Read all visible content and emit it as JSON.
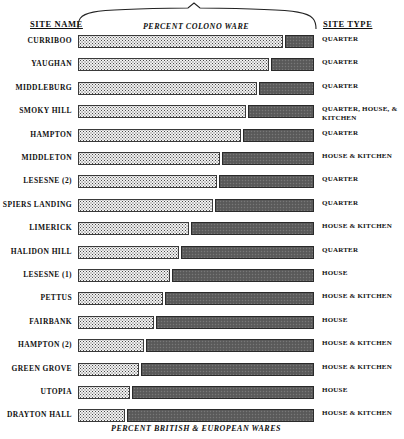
{
  "header": {
    "site_name_label": "SITE  NAME",
    "site_type_label": "SITE  TYPE"
  },
  "captions": {
    "top": "PERCENT COLONO WARE",
    "bottom": "PERCENT BRITISH & EUROPEAN WARES"
  },
  "colors": {
    "colono_fill": "#f2f2f2",
    "colono_stroke": "#3a3a3a",
    "british_fill": "#5e5e5e",
    "british_stroke": "#2a2a2a",
    "text": "#111111",
    "background": "#ffffff"
  },
  "chart_data": {
    "type": "bar",
    "orientation": "horizontal",
    "stacked": true,
    "title": "",
    "xlabel": "",
    "ylabel": "",
    "xlim": [
      0,
      100
    ],
    "grid": false,
    "legend_position": "none",
    "top_axis_label": "PERCENT COLONO WARE",
    "bottom_axis_label": "PERCENT BRITISH & EUROPEAN WARES",
    "categories": [
      "CURRIBOO",
      "YAUGHAN",
      "MIDDLEBURG",
      "SMOKY HILL",
      "HAMPTON",
      "MIDDLETON",
      "LESESNE (2)",
      "SPIERS LANDING",
      "LIMERICK",
      "HALIDON HILL",
      "LESESNE (1)",
      "PETTUS",
      "FAIRBANK",
      "HAMPTON (2)",
      "GREEN GROVE",
      "UTOPIA",
      "DRAYTON HALL"
    ],
    "series": [
      {
        "name": "PERCENT COLONO WARE",
        "values": [
          87,
          81,
          76,
          71,
          69,
          60,
          59,
          57,
          47,
          43,
          39,
          36,
          32,
          28,
          26,
          22,
          20
        ]
      },
      {
        "name": "PERCENT BRITISH & EUROPEAN WARES",
        "values": [
          13,
          19,
          24,
          29,
          31,
          40,
          41,
          43,
          53,
          57,
          61,
          64,
          68,
          72,
          74,
          78,
          80
        ]
      }
    ],
    "site_types": [
      "QUARTER",
      "QUARTER",
      "QUARTER",
      "QUARTER, HOUSE, & KITCHEN",
      "QUARTER",
      "HOUSE & KITCHEN",
      "QUARTER",
      "QUARTER",
      "HOUSE & KITCHEN",
      "QUARTER",
      "HOUSE",
      "HOUSE & KITCHEN",
      "HOUSE",
      "HOUSE & KITCHEN",
      "HOUSE & KITCHEN",
      "HOUSE",
      "HOUSE & KITCHEN"
    ]
  }
}
